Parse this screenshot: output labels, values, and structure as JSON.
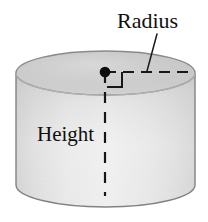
{
  "figure": {
    "name": "cylinder-dimensions-diagram",
    "shape": "cylinder",
    "background_color": "#ffffff"
  },
  "labels": {
    "radius": "Radius",
    "height": "Height"
  },
  "colors": {
    "ink": "#100f0f",
    "outline": "#6e6e6e",
    "top_face_light": "#d9d9d9",
    "top_face_dark": "#b9b9b9",
    "body_light": "#efefef",
    "body_mid": "#dcdcdc",
    "body_dark": "#c9c9c9",
    "background": "#ffffff"
  },
  "geometry": {
    "cylinder_left_x": 16,
    "cylinder_right_x": 195,
    "ellipse_center_x": 105.5,
    "top_ellipse_center_y": 73,
    "top_ellipse_rx": 89.5,
    "top_ellipse_ry": 22,
    "bottom_ellipse_center_y": 185,
    "bottom_ellipse_rx": 89.5,
    "bottom_ellipse_ry": 22,
    "center_dot_x": 105,
    "center_dot_y": 72,
    "center_dot_r": 5,
    "radius_line_end_x": 193,
    "height_line_end_y": 196,
    "right_angle_size": 15,
    "leader_line_start_x": 157,
    "leader_line_start_y": 34,
    "leader_line_end_x": 147,
    "leader_line_end_y": 71
  },
  "label_positions": {
    "radius_x": 117,
    "radius_y": 28,
    "height_x": 37,
    "height_y": 141
  },
  "annotations": {
    "center_dot": "center-point-dot",
    "radius_dashed_line": "radius-dashed-line",
    "height_dashed_line": "height-dashed-line",
    "right_angle_marker": "right-angle-marker",
    "radius_leader_line": "radius-leader-line"
  }
}
